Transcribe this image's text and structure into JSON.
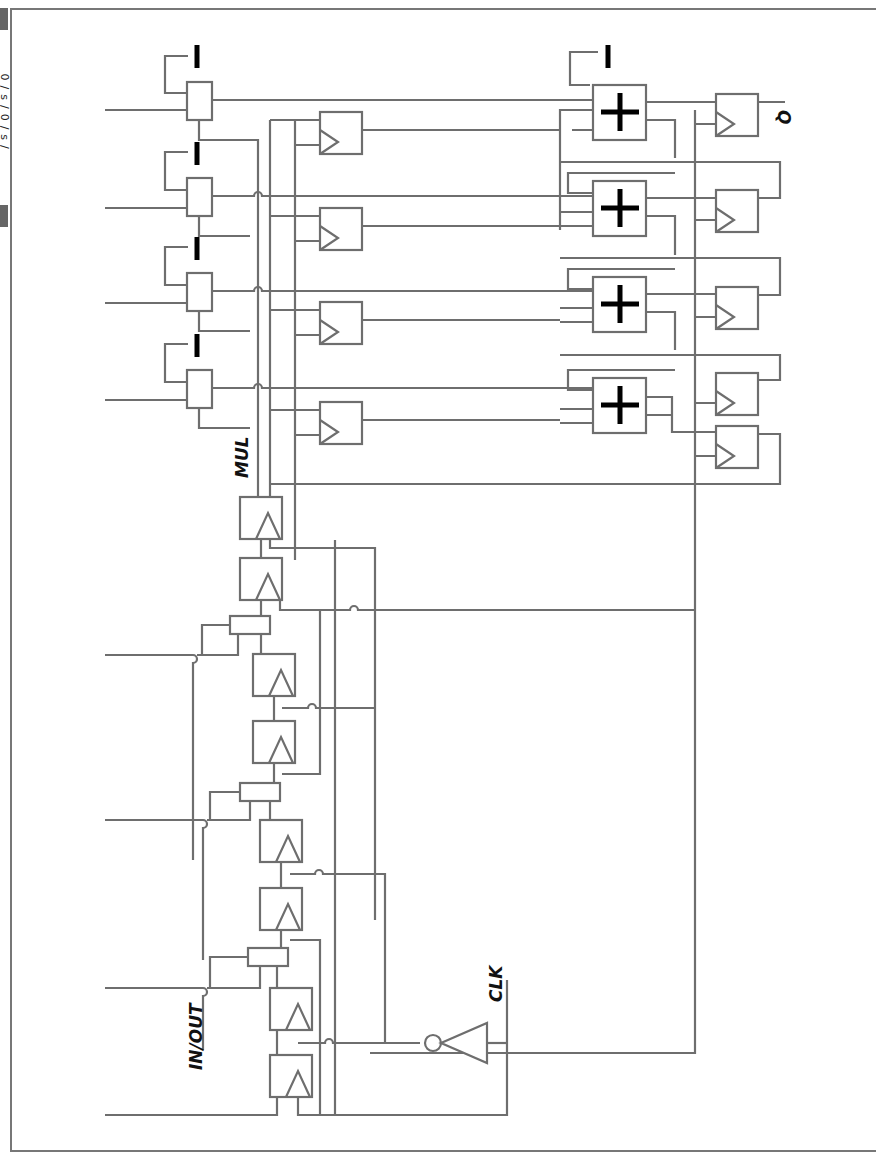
{
  "labels": {
    "in_out": "IN/OUT",
    "clk": "CLK",
    "mul": "MUL",
    "q": "Q",
    "side_tag": "0/s/0/s/"
  },
  "colors": {
    "wire": "#6e6e6e",
    "symbol": "#000000",
    "frame": "#777777"
  },
  "components": {
    "mux_blocks": 4,
    "adders": 4,
    "constant_minus": 5,
    "input_flipflops": 10,
    "mid_flipflops": 4,
    "output_flipflops": 5,
    "inverter": 1
  }
}
